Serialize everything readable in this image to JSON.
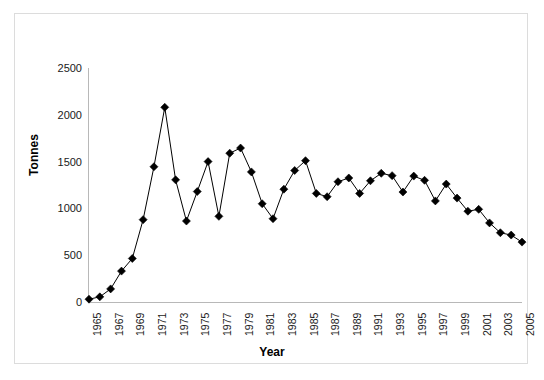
{
  "chart_data": {
    "type": "line",
    "title": "",
    "xlabel": "Year",
    "ylabel": "Tonnes",
    "xlim": [
      1965,
      2005
    ],
    "ylim": [
      0,
      2500
    ],
    "grid": false,
    "legend": null,
    "marker": "diamond",
    "y_ticks": [
      2500,
      2000,
      1500,
      1000,
      500,
      0
    ],
    "x_ticks": [
      "1965",
      "1967",
      "1969",
      "1971",
      "1973",
      "1975",
      "1977",
      "1979",
      "1981",
      "1983",
      "1985",
      "1987",
      "1989",
      "1991",
      "1993",
      "1995",
      "1997",
      "1999",
      "2001",
      "2003",
      "2005"
    ],
    "x": [
      1965,
      1966,
      1967,
      1968,
      1969,
      1970,
      1971,
      1972,
      1973,
      1974,
      1975,
      1976,
      1977,
      1978,
      1979,
      1980,
      1981,
      1982,
      1983,
      1984,
      1985,
      1986,
      1987,
      1988,
      1989,
      1990,
      1991,
      1992,
      1993,
      1994,
      1995,
      1996,
      1997,
      1998,
      1999,
      2000,
      2001,
      2002,
      2003,
      2004,
      2005
    ],
    "values": [
      30,
      55,
      140,
      330,
      465,
      880,
      1445,
      2080,
      1305,
      865,
      1180,
      1500,
      915,
      1590,
      1645,
      1390,
      1050,
      890,
      1205,
      1405,
      1510,
      1160,
      1125,
      1285,
      1325,
      1160,
      1295,
      1375,
      1350,
      1175,
      1345,
      1300,
      1080,
      1260,
      1110,
      970,
      990,
      845,
      740,
      715,
      640
    ],
    "series": [
      {
        "name": "Tonnes",
        "color": "#000000",
        "values": [
          30,
          55,
          140,
          330,
          465,
          880,
          1445,
          2080,
          1305,
          865,
          1180,
          1500,
          915,
          1590,
          1645,
          1390,
          1050,
          890,
          1205,
          1405,
          1510,
          1160,
          1125,
          1285,
          1325,
          1160,
          1295,
          1375,
          1350,
          1175,
          1345,
          1300,
          1080,
          1260,
          1110,
          970,
          990,
          845,
          740,
          715,
          640
        ]
      }
    ]
  },
  "colors": {
    "line": "#000000",
    "marker": "#000000",
    "axis": "#b8b8b8",
    "frame": "#dcdcdc",
    "text": "#1a1a1a",
    "background": "#ffffff"
  }
}
